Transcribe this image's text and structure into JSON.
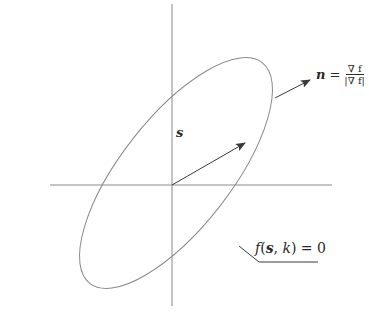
{
  "diagram": {
    "type": "geometry-figure",
    "colors": {
      "stroke": "#8a8a8a",
      "arrow": "#3a3a3a",
      "text": "#2a2a2a",
      "background": "#ffffff"
    },
    "labels": {
      "position_vector": "s",
      "normal_lhs": "n",
      "normal_equals": "=",
      "normal_num": "∇ f",
      "normal_den": "|∇ f|",
      "curve_f": "f",
      "curve_args_open": "(",
      "curve_arg_s": "s",
      "curve_sep": ", ",
      "curve_arg_k": "k",
      "curve_rest": ") = 0"
    },
    "elements": [
      {
        "id": "x-axis",
        "kind": "line"
      },
      {
        "id": "y-axis",
        "kind": "line"
      },
      {
        "id": "ellipse",
        "kind": "ellipse",
        "label": "f(s, k) = 0"
      },
      {
        "id": "vector-s",
        "kind": "arrow",
        "label": "s"
      },
      {
        "id": "vector-n",
        "kind": "arrow",
        "label": "n = ∇f / |∇f|"
      },
      {
        "id": "leader-line",
        "kind": "polyline"
      }
    ]
  }
}
